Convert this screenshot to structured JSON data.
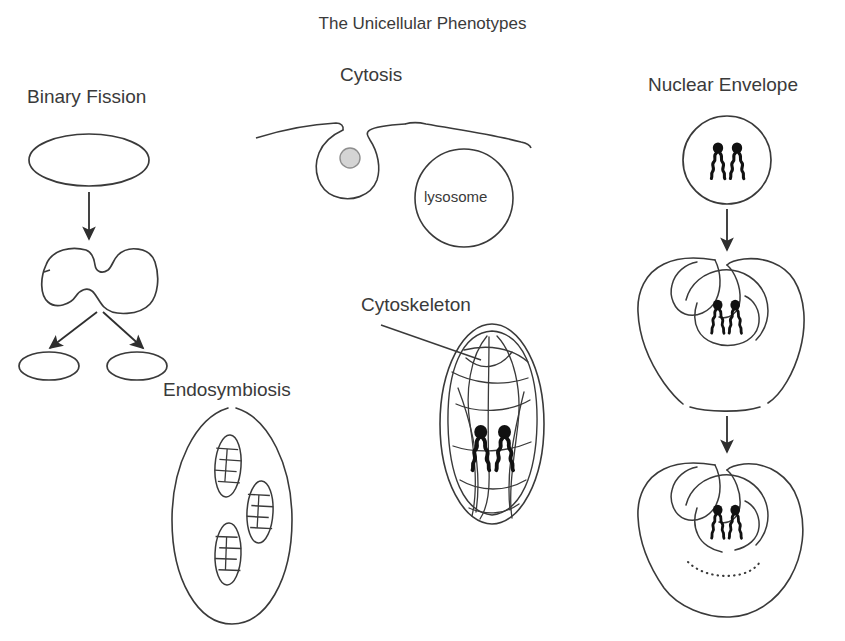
{
  "title": "The Unicellular Phenotypes",
  "labels": {
    "binary_fission": "Binary Fission",
    "cytosis": "Cytosis",
    "nuclear_envelope": "Nuclear Envelope",
    "cytoskeleton": "Cytoskeleton",
    "endosymbiosis": "Endosymbiosis",
    "lysosome": "lysosome"
  },
  "colors": {
    "stroke": "#3a3a3a",
    "text": "#3a3a3a",
    "background": "#ffffff",
    "particle_fill": "#d4d4d4",
    "chromosome_fill": "#111111"
  },
  "panels": [
    {
      "name": "binary-fission",
      "label": "Binary Fission",
      "stages": [
        {
          "name": "parent-cell",
          "shape": "ellipse"
        },
        {
          "name": "dividing-cell",
          "shape": "pinched-dumbbell"
        },
        {
          "name": "daughter-cell-left",
          "shape": "ellipse"
        },
        {
          "name": "daughter-cell-right",
          "shape": "ellipse"
        }
      ],
      "arrows": 3
    },
    {
      "name": "cytosis",
      "label": "Cytosis",
      "stages": [
        {
          "name": "plasma-membrane",
          "shape": "invaginating-membrane"
        },
        {
          "name": "engulfed-particle",
          "shape": "small-circle"
        },
        {
          "name": "lysosome",
          "shape": "circle",
          "label": "lysosome"
        }
      ],
      "arrows": 0
    },
    {
      "name": "cytoskeleton",
      "label": "Cytoskeleton",
      "stages": [
        {
          "name": "cell-outline",
          "shape": "vertical-oval"
        },
        {
          "name": "filament-network",
          "shape": "tangled-lines"
        },
        {
          "name": "chromosome-pair",
          "shape": "squiggle-pair"
        }
      ],
      "arrows": 0,
      "leader_line": true
    },
    {
      "name": "endosymbiosis",
      "label": "Endosymbiosis",
      "stages": [
        {
          "name": "host-cell",
          "shape": "vertical-oval"
        },
        {
          "name": "mitochondrion-1",
          "shape": "oval-with-cristae"
        },
        {
          "name": "mitochondrion-2",
          "shape": "oval-with-cristae"
        },
        {
          "name": "mitochondrion-3",
          "shape": "oval-with-cristae"
        }
      ],
      "arrows": 0
    },
    {
      "name": "nuclear-envelope",
      "label": "Nuclear Envelope",
      "stages": [
        {
          "name": "stage-1-circle-cell",
          "shape": "circle"
        },
        {
          "name": "stage-2-invaginating-envelope",
          "shape": "folded-membrane"
        },
        {
          "name": "stage-3-closed-envelope",
          "shape": "folded-membrane-dotted"
        }
      ],
      "arrows": 2,
      "chromosomes_per_stage": 2
    }
  ]
}
